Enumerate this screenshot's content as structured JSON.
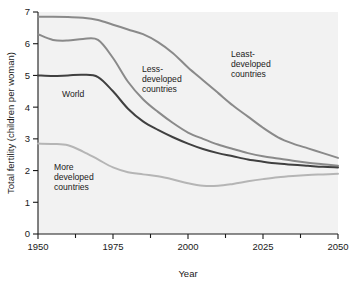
{
  "chart_data": {
    "type": "line",
    "title": "",
    "xlabel": "Year",
    "ylabel": "Total fertility (children per woman)",
    "xlim": [
      1950,
      2050
    ],
    "ylim": [
      0,
      7
    ],
    "grid": false,
    "legend_position": "inline-annotations",
    "xticks": [
      1950,
      1975,
      2000,
      2025,
      2050
    ],
    "xtick_labels": [
      "1950",
      "1975",
      "2000",
      "2025",
      "2050"
    ],
    "xminor_ticks": [
      1962.5,
      1987.5,
      2012.5,
      2037.5
    ],
    "yticks": [
      0,
      1,
      2,
      3,
      4,
      5,
      6,
      7
    ],
    "ytick_labels": [
      "0",
      "1",
      "2",
      "3",
      "4",
      "5",
      "6",
      "7"
    ],
    "x": [
      1950,
      1955,
      1960,
      1965,
      1970,
      1975,
      1980,
      1985,
      1990,
      1995,
      2000,
      2005,
      2010,
      2015,
      2020,
      2025,
      2030,
      2035,
      2040,
      2045,
      2050
    ],
    "series": [
      {
        "name": "Least-developed countries",
        "color": "#8a8a8a",
        "label_text": "Least-\ndeveloped\ncountries",
        "values": [
          6.85,
          6.85,
          6.84,
          6.82,
          6.75,
          6.6,
          6.45,
          6.3,
          6.05,
          5.7,
          5.25,
          4.85,
          4.45,
          4.05,
          3.7,
          3.35,
          3.05,
          2.85,
          2.7,
          2.55,
          2.4
        ]
      },
      {
        "name": "Less-developed countries",
        "color": "#8a8a8a",
        "label_text": "Less-\ndeveloped\ncountries",
        "values": [
          6.3,
          6.12,
          6.1,
          6.15,
          6.12,
          5.55,
          4.8,
          4.25,
          3.85,
          3.5,
          3.2,
          3.0,
          2.82,
          2.68,
          2.55,
          2.45,
          2.38,
          2.31,
          2.25,
          2.2,
          2.15
        ]
      },
      {
        "name": "World",
        "color": "#404040",
        "label_text": "World",
        "values": [
          5.0,
          4.98,
          5.0,
          5.02,
          4.95,
          4.5,
          3.95,
          3.55,
          3.28,
          3.05,
          2.85,
          2.68,
          2.55,
          2.45,
          2.35,
          2.28,
          2.22,
          2.18,
          2.15,
          2.12,
          2.1
        ]
      },
      {
        "name": "More developed countries",
        "color": "#b5b5b5",
        "label_text": "More\ndeveloped\ncountries",
        "values": [
          2.85,
          2.84,
          2.8,
          2.6,
          2.35,
          2.1,
          1.95,
          1.88,
          1.82,
          1.72,
          1.6,
          1.52,
          1.52,
          1.58,
          1.66,
          1.73,
          1.79,
          1.83,
          1.86,
          1.88,
          1.9
        ]
      }
    ],
    "annotations": [
      {
        "text_lines": [
          "Least-",
          "developed",
          "countries"
        ],
        "x_px": 231,
        "y_px": 57
      },
      {
        "text_lines": [
          "Less-",
          "developed",
          "countries"
        ],
        "x_px": 142,
        "y_px": 72
      },
      {
        "text_lines": [
          "World"
        ],
        "x_px": 62,
        "y_px": 97
      },
      {
        "text_lines": [
          "More",
          "developed",
          "countries"
        ],
        "x_px": 54,
        "y_px": 170
      }
    ]
  },
  "axes": {
    "x_axis_title": "Year",
    "y_axis_title": "Total fertility (children per woman)"
  }
}
